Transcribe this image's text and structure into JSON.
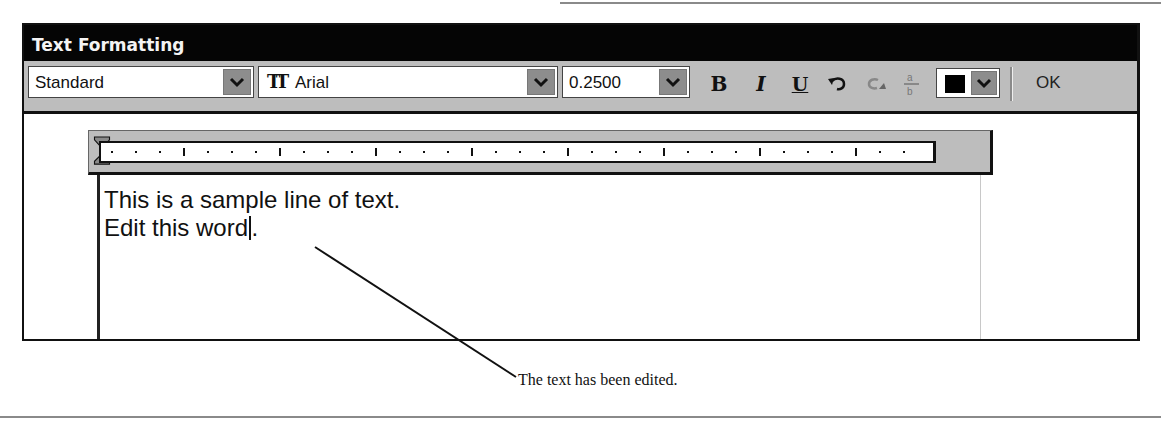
{
  "window": {
    "title": "Text Formatting"
  },
  "toolbar": {
    "style": {
      "value": "Standard",
      "icon": "chevron-down-icon"
    },
    "font": {
      "value": "Arial",
      "icon": "truetype-font-icon",
      "icon_text": "TT"
    },
    "height": {
      "value": "0.2500",
      "icon": "chevron-down-icon"
    },
    "buttons": [
      {
        "name": "bold",
        "label": "B"
      },
      {
        "name": "italic",
        "label": "I"
      },
      {
        "name": "underline",
        "label": "U"
      },
      {
        "name": "undo",
        "icon": "undo-icon"
      },
      {
        "name": "redo",
        "icon": "redo-icon"
      },
      {
        "name": "stack",
        "icon": "stack-fraction-icon"
      }
    ],
    "color": {
      "value": "#000000",
      "label": "ByBlock/Black"
    },
    "ok_label": "OK"
  },
  "ruler": {
    "major_ticks": 9,
    "minor_per_major": 3
  },
  "editor": {
    "lines": [
      "This is a sample line of text.",
      "Edit this word"
    ],
    "line2_after_caret": "."
  },
  "callout": {
    "text": "The text has been edited."
  },
  "colors": {
    "titlebar": "#050505",
    "toolbar": "#bdbdbd",
    "arrow_button": "#8d8d8d"
  }
}
